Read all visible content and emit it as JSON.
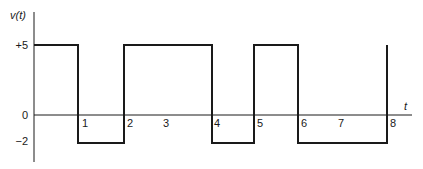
{
  "chart_data": {
    "type": "line",
    "step": true,
    "title": "",
    "ylabel": "v(t)",
    "xlabel": "t",
    "y_ticks": [
      {
        "value": 5,
        "label": "+5"
      },
      {
        "value": 0,
        "label": "0"
      },
      {
        "value": -2,
        "label": "−2"
      }
    ],
    "x_tick_labels": [
      "1",
      "2",
      "3",
      "4",
      "5",
      "6",
      "7",
      "8"
    ],
    "x": [
      0,
      1,
      1,
      2,
      2,
      4,
      4,
      5,
      5,
      6,
      6,
      8,
      8
    ],
    "y": [
      5,
      5,
      -2,
      -2,
      5,
      5,
      -2,
      -2,
      5,
      5,
      -2,
      -2,
      5
    ],
    "segments": [
      {
        "from": 0,
        "to": 1,
        "value": 5
      },
      {
        "from": 1,
        "to": 2,
        "value": -2
      },
      {
        "from": 2,
        "to": 4,
        "value": 5
      },
      {
        "from": 4,
        "to": 5,
        "value": -2
      },
      {
        "from": 5,
        "to": 6,
        "value": 5
      },
      {
        "from": 6,
        "to": 8,
        "value": -2
      }
    ],
    "xlim": [
      0,
      8.5
    ],
    "ylim": [
      -3,
      6
    ],
    "grid": false,
    "legend": null,
    "line_color": "#1a1a1a"
  }
}
